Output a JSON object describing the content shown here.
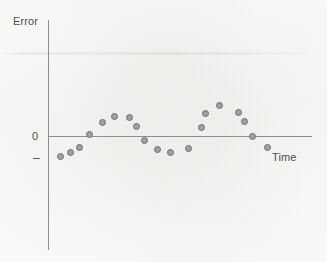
{
  "figure": {
    "background_color": "#fdfdfc",
    "axis_color": "#8e8e90",
    "text_color": "#4d4d4f",
    "marker_fill": "#a0a0a2",
    "marker_stroke": "#6f6f72"
  },
  "labels": {
    "y_axis": "Error",
    "x_axis": "Time",
    "tick_zero": "0",
    "tick_minus": "–"
  },
  "chart_data": {
    "type": "scatter",
    "title": "",
    "xlabel": "Time",
    "ylabel": "Error",
    "grid": false,
    "legend": null,
    "xlim": [
      0,
      21
    ],
    "ylim": [
      -1.35,
      1.35
    ],
    "yticks": [
      0
    ],
    "ytick_labels": [
      "0"
    ],
    "xticks": [],
    "xtick_labels": [],
    "zero_reference_line": true,
    "series": [
      {
        "name": "Residual error",
        "marker": "circle",
        "points": [
          {
            "x": 1,
            "y": -0.8,
            "px": 60,
            "py": 156
          },
          {
            "x": 2,
            "y": -0.6,
            "px": 70,
            "py": 152
          },
          {
            "x": 3,
            "y": -0.4,
            "px": 79,
            "py": 147
          },
          {
            "x": 4,
            "y": 0.1,
            "px": 89,
            "py": 134
          },
          {
            "x": 5,
            "y": 0.55,
            "px": 102,
            "py": 122
          },
          {
            "x": 6,
            "y": 0.8,
            "px": 114,
            "py": 116
          },
          {
            "x": 7,
            "y": 0.76,
            "px": 129,
            "py": 117
          },
          {
            "x": 8,
            "y": 0.42,
            "px": 136,
            "py": 126
          },
          {
            "x": 9,
            "y": -0.18,
            "px": 144,
            "py": 140
          },
          {
            "x": 10,
            "y": -0.56,
            "px": 157,
            "py": 149
          },
          {
            "x": 11,
            "y": -0.68,
            "px": 170,
            "py": 152
          },
          {
            "x": 12,
            "y": -0.5,
            "px": 188,
            "py": 148
          },
          {
            "x": 13,
            "y": 0.38,
            "px": 201,
            "py": 127
          },
          {
            "x": 14,
            "y": 0.94,
            "px": 205,
            "py": 113
          },
          {
            "x": 15,
            "y": 1.26,
            "px": 219,
            "py": 105
          },
          {
            "x": 16,
            "y": 0.96,
            "px": 238,
            "py": 112
          },
          {
            "x": 17,
            "y": 0.62,
            "px": 244,
            "py": 121
          },
          {
            "x": 18,
            "y": 0.0,
            "px": 252,
            "py": 136
          },
          {
            "x": 19,
            "y": -0.44,
            "px": 267,
            "py": 147
          }
        ]
      }
    ]
  }
}
